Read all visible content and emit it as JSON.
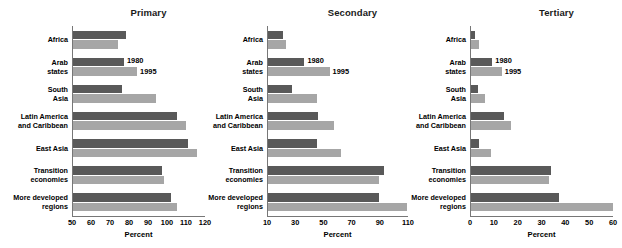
{
  "chart_data": [
    {
      "type": "bar",
      "orientation": "horizontal",
      "title": "Primary",
      "xlabel": "Percent",
      "ylabel": "",
      "xlim": [
        50,
        120
      ],
      "xticks": [
        50,
        60,
        70,
        80,
        90,
        100,
        110,
        120
      ],
      "grid": false,
      "legend": [
        "1980",
        "1995"
      ],
      "legend_position": "inside-plot-second-group",
      "categories": [
        "Africa",
        "Arab\nstates",
        "South\nAsia",
        "Latin America\nand Caribbean",
        "East Asia",
        "Transition\neconomies",
        "More developed\nregions"
      ],
      "series": [
        {
          "name": "1980",
          "color": "#595959",
          "values": [
            78,
            77,
            76,
            105,
            111,
            97,
            102
          ]
        },
        {
          "name": "1995",
          "color": "#a6a6a6",
          "values": [
            74,
            84,
            94,
            110,
            116,
            98,
            105
          ]
        }
      ]
    },
    {
      "type": "bar",
      "orientation": "horizontal",
      "title": "Secondary",
      "xlabel": "Percent",
      "ylabel": "",
      "xlim": [
        10,
        110
      ],
      "xticks": [
        10,
        30,
        50,
        70,
        90,
        110
      ],
      "grid": false,
      "legend": [
        "1980",
        "1995"
      ],
      "legend_position": "inside-plot-second-group",
      "categories": [
        "Africa",
        "Arab\nstates",
        "South\nAsia",
        "Latin America\nand Caribbean",
        "East Asia",
        "Transition\neconomies",
        "More developed\nregions"
      ],
      "series": [
        {
          "name": "1980",
          "color": "#595959",
          "values": [
            21,
            36,
            27,
            46,
            45,
            93,
            89
          ]
        },
        {
          "name": "1995",
          "color": "#a6a6a6",
          "values": [
            23,
            54,
            45,
            57,
            62,
            89,
            109
          ]
        }
      ]
    },
    {
      "type": "bar",
      "orientation": "horizontal",
      "title": "Tertiary",
      "xlabel": "Percent",
      "ylabel": "",
      "xlim": [
        0,
        60
      ],
      "xticks": [
        0,
        10,
        20,
        30,
        40,
        50,
        60
      ],
      "grid": false,
      "legend": [
        "1980",
        "1995"
      ],
      "legend_position": "inside-plot-second-group",
      "categories": [
        "Africa",
        "Arab\nstates",
        "South\nAsia",
        "Latin America\nand Caribbean",
        "East Asia",
        "Transition\neconomies",
        "More developed\nregions"
      ],
      "series": [
        {
          "name": "1980",
          "color": "#595959",
          "values": [
            1.5,
            9,
            3,
            14,
            3.5,
            34,
            37
          ]
        },
        {
          "name": "1995",
          "color": "#a6a6a6",
          "values": [
            3.5,
            13,
            6,
            17,
            8.5,
            33,
            60
          ]
        }
      ]
    }
  ]
}
